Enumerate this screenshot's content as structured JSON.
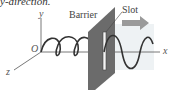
{
  "caption": "y-direction.",
  "labels": {
    "barrier": "Barrier",
    "slot": "Slot",
    "origin": "O",
    "axis_x": "x",
    "axis_y": "y",
    "axis_z": "z"
  },
  "colors": {
    "barrier": "#6b6b6b",
    "wave": "#333333",
    "arrow": "#9a9a9a",
    "axes": "#555555"
  }
}
